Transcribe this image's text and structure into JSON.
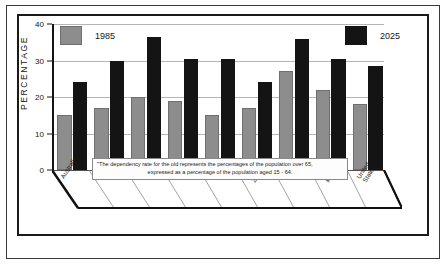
{
  "chart_data": {
    "type": "bar",
    "title": "",
    "xlabel": "",
    "ylabel": "PERCENTAGE",
    "ylim": [
      0,
      40
    ],
    "yticks": [
      "0",
      "10",
      "20",
      "30",
      "40"
    ],
    "grid": true,
    "legend_position": "inside-top-left-and-top-right",
    "categories": [
      "Australia",
      "France",
      "Germany",
      "Italy",
      "Japan",
      "New Zealand",
      "Sweden",
      "United Kingdom",
      "United States"
    ],
    "series": [
      {
        "name": "1985",
        "color": "#8d8d8d",
        "values": [
          15,
          17,
          20,
          19,
          15,
          17,
          27,
          22,
          18
        ]
      },
      {
        "name": "2025",
        "color": "#141414",
        "values": [
          24,
          30,
          36.5,
          30.5,
          30.5,
          24,
          36,
          30.5,
          28.5
        ]
      }
    ],
    "annotation": "\"The dependency rate for the old represents the percentages of the population over 65, expressed as a percentage of the population aged 15 - 64."
  },
  "footnote": {
    "line1": "\"The dependency rate for the old represents the percentages of the population over 65,",
    "line2": "expressed as a percentage of the population aged 15 - 64."
  },
  "legend": {
    "first_label": "1985",
    "second_label": "2025"
  },
  "axis": {
    "y_title": "PERCENTAGE"
  }
}
